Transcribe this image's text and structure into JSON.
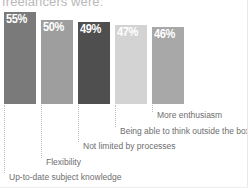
{
  "chart_data": {
    "type": "bar",
    "title": "freelancers were:",
    "xlabel": "",
    "ylabel": "",
    "ylim": [
      0,
      60
    ],
    "grid": false,
    "legend": null,
    "categories": [
      "Up-to-date subject knowledge",
      "Flexibility",
      "Not limited by processes",
      "Being able to think outside the box",
      "More enthusiasm"
    ],
    "values": [
      55,
      50,
      49,
      47,
      46
    ],
    "value_labels": [
      "55%",
      "50%",
      "49%",
      "47%",
      "46%"
    ],
    "bar_colors": [
      "#7a7a7a",
      "#9e9e9e",
      "#4f4f4f",
      "#d3d3d3",
      "#a8a8a8"
    ]
  },
  "chart": {
    "title": "freelancers were:",
    "bars": [
      {
        "value_label": "55%",
        "category": "Up-to-date subject knowledge",
        "color": "#7a7a7a",
        "left": 4,
        "width": 32,
        "height": 92,
        "leader_top": 105,
        "leader_height": 68,
        "label_left": 9,
        "label_top": 172
      },
      {
        "value_label": "50%",
        "category": "Flexibility",
        "color": "#9e9e9e",
        "left": 41,
        "width": 32,
        "height": 84,
        "leader_top": 105,
        "leader_height": 53,
        "label_left": 46,
        "label_top": 157
      },
      {
        "value_label": "49%",
        "category": "Not limited by processes",
        "color": "#4f4f4f",
        "left": 78,
        "width": 32,
        "height": 82,
        "leader_top": 105,
        "leader_height": 37,
        "label_left": 83,
        "label_top": 141
      },
      {
        "value_label": "47%",
        "category": "Being able to think outside the box",
        "color": "#d3d3d3",
        "left": 115,
        "width": 32,
        "height": 79,
        "leader_top": 105,
        "leader_height": 22,
        "label_left": 120,
        "label_top": 126
      },
      {
        "value_label": "46%",
        "category": "More enthusiasm",
        "color": "#a8a8a8",
        "left": 152,
        "width": 32,
        "height": 77,
        "leader_top": 105,
        "leader_height": 7,
        "label_left": 157,
        "label_top": 110
      }
    ]
  }
}
